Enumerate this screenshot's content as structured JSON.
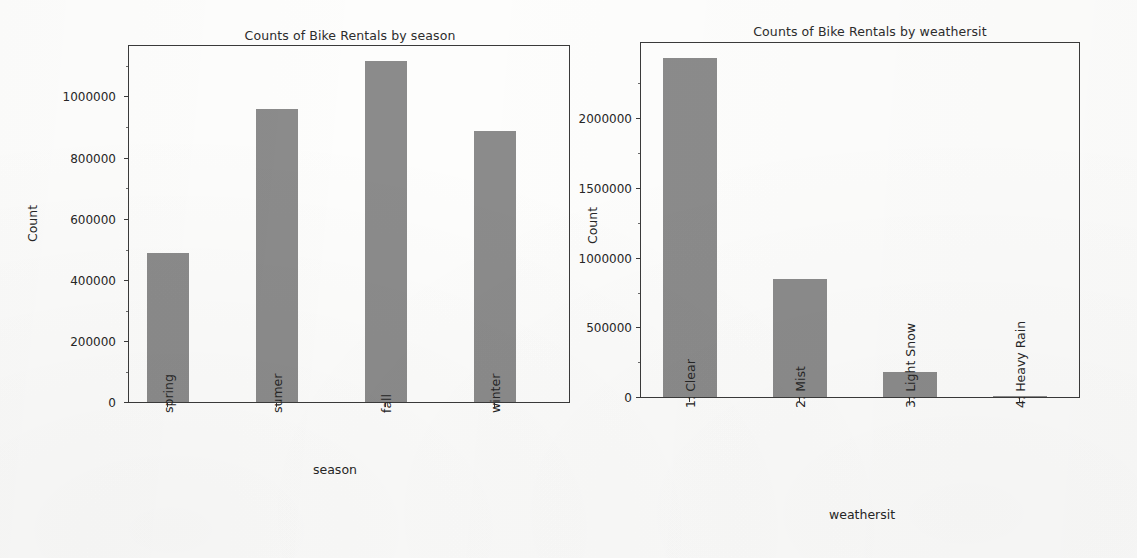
{
  "figure": {
    "background_color": "#fdfdfc",
    "bar_color": "#8b8b8b",
    "axis_color": "#3a3a3a",
    "text_color": "#262626"
  },
  "charts": [
    {
      "id": "bike-rentals-by-season",
      "title": "Counts of Bike Rentals by season",
      "xlabel": "season",
      "ylabel": "Count",
      "ytick_labels": [
        "0",
        "200000",
        "400000",
        "600000",
        "800000",
        "1000000"
      ],
      "xtick_labels": [
        "spring",
        "sumer",
        "fall",
        "winter"
      ]
    },
    {
      "id": "bike-rentals-by-weathersit",
      "title": "Counts of Bike Rentals by weathersit",
      "xlabel": "weathersit",
      "ylabel": "Count",
      "ytick_labels": [
        "0",
        "500000",
        "1000000",
        "1500000",
        "2000000"
      ],
      "xtick_labels": [
        "1: Clear",
        "2: Mist",
        "3: Light Snow",
        "4: Heavy Rain"
      ]
    }
  ],
  "chart_data": [
    {
      "type": "bar",
      "title": "Counts of Bike Rentals by season",
      "xlabel": "season",
      "ylabel": "Count",
      "categories": [
        "spring",
        "sumer",
        "fall",
        "winter"
      ],
      "values": [
        471000,
        925000,
        1075000,
        855000
      ],
      "ylim": [
        0,
        1130000
      ],
      "yticks": [
        0,
        200000,
        400000,
        600000,
        800000,
        1000000
      ],
      "grid": false,
      "legend": "none",
      "bar_color": "#8b8b8b"
    },
    {
      "type": "bar",
      "title": "Counts of Bike Rentals by weathersit",
      "xlabel": "weathersit",
      "ylabel": "Count",
      "categories": [
        "1: Clear",
        "2: Mist",
        "3: Light Snow",
        "4: Heavy Rain"
      ],
      "values": [
        2330000,
        810000,
        175000,
        0
      ],
      "ylim": [
        0,
        2450000
      ],
      "yticks": [
        0,
        500000,
        1000000,
        1500000,
        2000000
      ],
      "grid": false,
      "legend": "none",
      "bar_color": "#8b8b8b"
    }
  ]
}
